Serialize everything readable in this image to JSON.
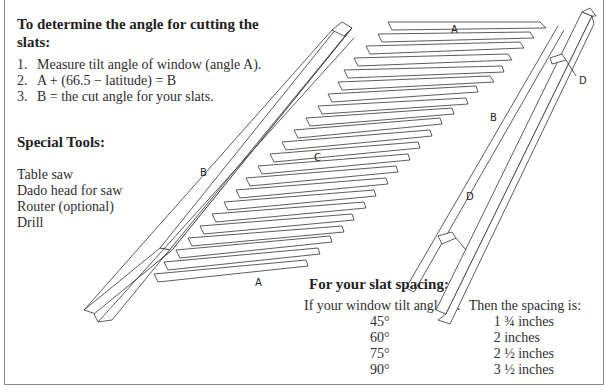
{
  "cutting_section": {
    "heading": "To determine the angle for cutting the slats:",
    "steps": [
      {
        "number": "1.",
        "text": "Measure tilt angle of window (angle A)."
      },
      {
        "number": "2.",
        "text": "A + (66.5 − latitude) = B"
      },
      {
        "number": "3.",
        "text": "B = the cut angle for your slats."
      }
    ]
  },
  "tools_section": {
    "heading": "Special Tools:",
    "items": [
      "Table saw",
      "Dado head for saw",
      "Router (optional)",
      "Drill"
    ]
  },
  "spacing_section": {
    "heading": "For your slat spacing:",
    "column_headers": [
      "If your window tilt angle is:",
      "Then the spacing is:"
    ],
    "rows": [
      {
        "angle": "45°",
        "spacing": "1 ¾ inches"
      },
      {
        "angle": "60°",
        "spacing": "2 inches"
      },
      {
        "angle": "75°",
        "spacing": "2 ½ inches"
      },
      {
        "angle": "90°",
        "spacing": "3 ½ inches"
      }
    ]
  },
  "diagram": {
    "labels": {
      "slat_top": "A",
      "slat_bottom": "A",
      "slats_middle": "C",
      "rail_left": "B",
      "rail_right": "B",
      "bracket_upper": "D",
      "bracket_lower": "D"
    }
  }
}
